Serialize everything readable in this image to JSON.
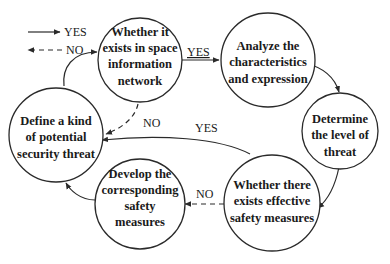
{
  "legend": {
    "yes": {
      "label": "YES",
      "style": "solid"
    },
    "no": {
      "label": "NO",
      "style": "dashed"
    }
  },
  "nodes": [
    {
      "id": "n1",
      "lines": [
        "Whether it",
        "exists in space",
        "information",
        "network"
      ]
    },
    {
      "id": "n2",
      "lines": [
        "Analyze the",
        "characteristics",
        "and expression"
      ]
    },
    {
      "id": "n3",
      "lines": [
        "Determine",
        "the level of",
        "threat"
      ]
    },
    {
      "id": "n4",
      "lines": [
        "Whether there",
        "exists effective",
        "safety measures"
      ]
    },
    {
      "id": "n5",
      "lines": [
        "Develop the",
        "corresponding",
        "safety",
        "measures"
      ]
    },
    {
      "id": "n6",
      "lines": [
        "Define a kind",
        "of potential",
        "security threat"
      ]
    }
  ],
  "edges": [
    {
      "from": "n1",
      "to": "n2",
      "label": "YES",
      "style": "solid"
    },
    {
      "from": "n2",
      "to": "n3",
      "label": "",
      "style": "solid"
    },
    {
      "from": "n3",
      "to": "n4",
      "label": "",
      "style": "solid"
    },
    {
      "from": "n4",
      "to": "n6",
      "label": "YES",
      "style": "solid"
    },
    {
      "from": "n4",
      "to": "n5",
      "label": "NO",
      "style": "dashed"
    },
    {
      "from": "n5",
      "to": "n6",
      "label": "",
      "style": "solid"
    },
    {
      "from": "n6",
      "to": "n1",
      "label": "",
      "style": "solid"
    },
    {
      "from": "n1",
      "to": "n6",
      "label": "NO",
      "style": "dashed"
    }
  ],
  "colors": {
    "stroke": "#2a2a2a",
    "text": "#1a1a1a",
    "background": "#ffffff"
  }
}
